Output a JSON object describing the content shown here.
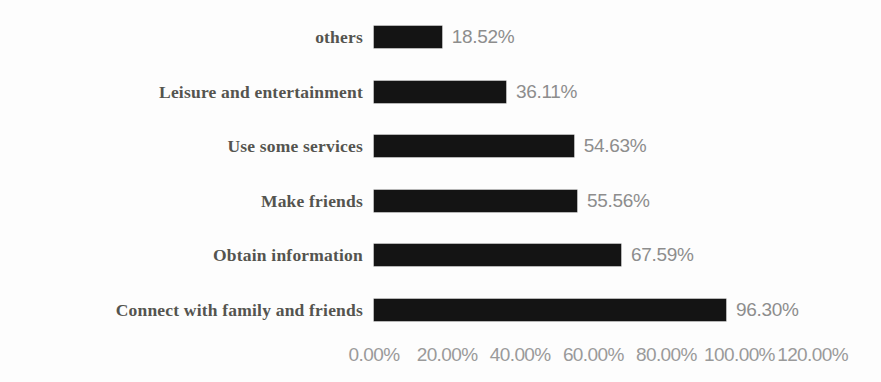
{
  "chart_data": {
    "type": "bar",
    "orientation": "horizontal",
    "title": "",
    "subtitle": "",
    "xlabel": "",
    "ylabel": "",
    "grid": false,
    "legend": null,
    "xlim": [
      0,
      120
    ],
    "categories": [
      "others",
      "Leisure and entertainment",
      "Use some services",
      "Make friends",
      "Obtain information",
      "Connect with family and friends"
    ],
    "values": [
      18.52,
      36.11,
      54.63,
      55.56,
      67.59,
      96.3
    ],
    "value_labels": [
      "18.52%",
      "36.11%",
      "54.63%",
      "55.56%",
      "67.59%",
      "96.30%"
    ],
    "tick_values": [
      0,
      20,
      40,
      60,
      80,
      100,
      120
    ],
    "tick_labels": [
      "0.00%",
      "20.00%",
      "40.00%",
      "60.00%",
      "80.00%",
      "100.00%",
      "120.00%"
    ],
    "bar_color": "#141414",
    "label_color": "#54544f",
    "value_color": "#8d8d8d",
    "tick_color": "#9a9a9a",
    "background_color": "#fdfdfd"
  },
  "rows": [
    {
      "label": "others",
      "value_label": "18.52%",
      "value": 18.52
    },
    {
      "label": "Leisure and entertainment",
      "value_label": "36.11%",
      "value": 36.11
    },
    {
      "label": "Use some services",
      "value_label": "54.63%",
      "value": 54.63
    },
    {
      "label": "Make friends",
      "value_label": "55.56%",
      "value": 55.56
    },
    {
      "label": "Obtain information",
      "value_label": "67.59%",
      "value": 67.59
    },
    {
      "label": "Connect with family and friends",
      "value_label": "96.30%",
      "value": 96.3
    }
  ],
  "axis": {
    "ticks": [
      {
        "label": "0.00%",
        "value": 0
      },
      {
        "label": "20.00%",
        "value": 20
      },
      {
        "label": "40.00%",
        "value": 40
      },
      {
        "label": "60.00%",
        "value": 60
      },
      {
        "label": "80.00%",
        "value": 80
      },
      {
        "label": "100.00%",
        "value": 100
      },
      {
        "label": "120.00%",
        "value": 120
      }
    ]
  }
}
